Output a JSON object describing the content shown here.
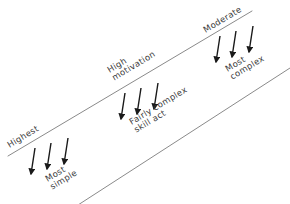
{
  "diagram": {
    "style": {
      "background": "#ffffff",
      "line_color": "#8a8a8a",
      "arrow_color": "#1a1a1a",
      "text_color": "#3a3a3a"
    },
    "axes": [
      {
        "name": "upper-line",
        "x1": 8,
        "y1": 156,
        "x2": 252,
        "y2": 11
      },
      {
        "name": "lower-line",
        "x1": 78,
        "y1": 205,
        "x2": 290,
        "y2": 68
      }
    ],
    "labels": [
      {
        "name": "highest",
        "text": "Highest",
        "x": 6,
        "y": 142,
        "rotate": -31
      },
      {
        "name": "most-simple",
        "text": "Most\nsimple",
        "x": 44,
        "y": 176,
        "rotate": -31
      },
      {
        "name": "high-motivation",
        "text": "High\nmotivation",
        "x": 106,
        "y": 67,
        "rotate": -31
      },
      {
        "name": "fairly-complex-skill-act",
        "text": "Fairly complex\nskill act",
        "x": 128,
        "y": 119,
        "rotate": -31
      },
      {
        "name": "moderate",
        "text": "Moderate",
        "x": 202,
        "y": 27,
        "rotate": -31
      },
      {
        "name": "most-complex",
        "text": "Most\ncomplex",
        "x": 224,
        "y": 66,
        "rotate": -31
      }
    ],
    "arrow_groups": [
      {
        "name": "arrow-group-left",
        "arrows": [
          {
            "x1": 35,
            "y1": 148,
            "x2": 31,
            "y2": 174
          },
          {
            "x1": 51,
            "y1": 143,
            "x2": 47,
            "y2": 169
          },
          {
            "x1": 68,
            "y1": 138,
            "x2": 64,
            "y2": 164
          }
        ]
      },
      {
        "name": "arrow-group-middle",
        "arrows": [
          {
            "x1": 125,
            "y1": 93,
            "x2": 121,
            "y2": 119
          },
          {
            "x1": 141,
            "y1": 88,
            "x2": 137,
            "y2": 114
          },
          {
            "x1": 158,
            "y1": 83,
            "x2": 154,
            "y2": 109
          }
        ]
      },
      {
        "name": "arrow-group-right",
        "arrows": [
          {
            "x1": 220,
            "y1": 36,
            "x2": 216,
            "y2": 62
          },
          {
            "x1": 236,
            "y1": 31,
            "x2": 232,
            "y2": 57
          },
          {
            "x1": 253,
            "y1": 26,
            "x2": 249,
            "y2": 52
          }
        ]
      }
    ]
  }
}
